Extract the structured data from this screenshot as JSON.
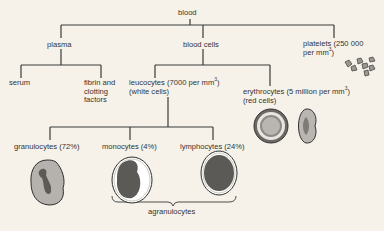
{
  "diagram": {
    "root": {
      "label": "blood"
    },
    "plasma": {
      "label": "plasma"
    },
    "serum": {
      "label": "serum"
    },
    "fibrin": {
      "line1": "fibrin and",
      "line2": "clotting",
      "line3": "factors"
    },
    "blood_cells": {
      "label": "blood cells"
    },
    "platelets": {
      "line1": "platelets (250 000",
      "line2a": "per mm",
      "line2_sup": "3",
      "line2b": ")"
    },
    "leucocytes": {
      "line1a": "leucocytes (7000 per mm",
      "line1_sup": "3",
      "line1b": ")",
      "line2": "(white cells)"
    },
    "erythrocytes": {
      "line1a": "erythrocytes (5 million per mm",
      "line1_sup": "3",
      "line1b": ")",
      "line2": "(red cells)"
    },
    "granulocytes": {
      "label": "granulocytes (72%)"
    },
    "monocytes": {
      "label": "monocytes (4%)"
    },
    "lymphocytes": {
      "label": "lymphocytes (24%)"
    },
    "agranulocytes": {
      "label": "agranulocytes"
    },
    "colors": {
      "background": "#f6f2e9",
      "line": "#3a3a3a",
      "cell_fill_light": "#b5b2ad",
      "cell_nucleus": "#555555",
      "red_cell_ring": "#8a8784"
    }
  }
}
